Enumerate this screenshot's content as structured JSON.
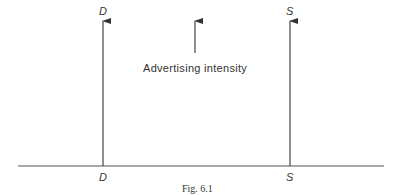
{
  "diagram": {
    "type": "economics-diagram",
    "curves": [
      {
        "id": "D",
        "top_label": "D",
        "bottom_label": "D",
        "orientation": "vertical",
        "x_position": "left"
      },
      {
        "id": "S",
        "top_label": "S",
        "bottom_label": "S",
        "orientation": "vertical",
        "x_position": "right"
      }
    ],
    "annotation": {
      "label": "Advertising intensity",
      "arrow_direction": "up"
    },
    "caption": "Fig. 6.1",
    "colors": {
      "line": "#444444",
      "text": "#333333",
      "background": "#ffffff"
    }
  }
}
